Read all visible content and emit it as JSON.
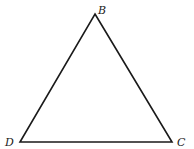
{
  "diagram": {
    "type": "triangle",
    "stroke_color": "#1a1a1a",
    "vertices": [
      {
        "name": "B",
        "x": 95,
        "y": 14,
        "label_x": 98,
        "label_y": 14
      },
      {
        "name": "D",
        "x": 20,
        "y": 142,
        "label_x": 5,
        "label_y": 146
      },
      {
        "name": "C",
        "x": 172,
        "y": 142,
        "label_x": 177,
        "label_y": 146
      }
    ],
    "labels": {
      "b": "B",
      "d": "D",
      "c": "C"
    }
  }
}
